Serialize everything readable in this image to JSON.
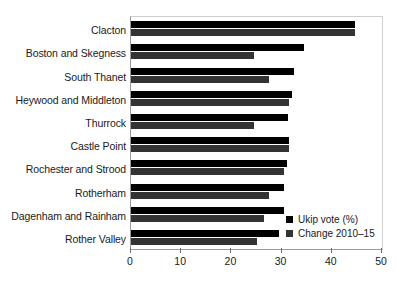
{
  "chart_data": {
    "type": "bar",
    "orientation": "horizontal",
    "title": "",
    "subtitle": "",
    "xlabel": "",
    "ylabel": "",
    "xlim": [
      0,
      50
    ],
    "xticks": [
      0,
      10,
      20,
      30,
      40,
      50
    ],
    "xtick_labels": [
      "0",
      "10",
      "20",
      "30",
      "40",
      "50"
    ],
    "grid": false,
    "legend_position": "bottom-right",
    "categories": [
      "Clacton",
      "Boston and Skegness",
      "South Thanet",
      "Heywood and Middleton",
      "Thurrock",
      "Castle Point",
      "Rochester and Strood",
      "Rotherham",
      "Dagenham and Rainham",
      "Rother Valley"
    ],
    "series": [
      {
        "name": "Ukip vote (%)",
        "color": "#000000",
        "values": [
          44.6,
          34.5,
          32.5,
          32.0,
          31.3,
          31.5,
          31.0,
          30.5,
          30.5,
          29.5
        ]
      },
      {
        "name": "Change 2010–15",
        "color": "#333333",
        "values": [
          44.6,
          24.5,
          27.5,
          31.5,
          24.5,
          31.5,
          30.5,
          27.5,
          26.5,
          25.0
        ]
      }
    ],
    "legend": [
      "Ukip vote (%)",
      "Change 2010–15"
    ]
  }
}
